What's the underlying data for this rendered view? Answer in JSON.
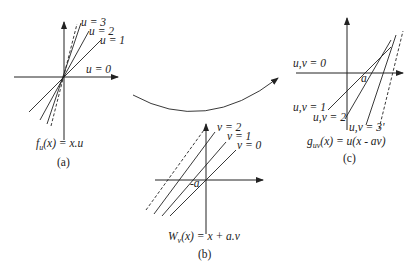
{
  "figure": {
    "panel_a": {
      "caption": "(a)",
      "formula": "fᵤ(x) = x.u",
      "formula_main": "f",
      "formula_sub": "u",
      "formula_rest": "(x) = x.u",
      "line_labels": [
        "u = 3",
        "u = 2",
        "u = 1",
        "u = 0"
      ]
    },
    "panel_b": {
      "caption": "(b)",
      "formula_main": "W",
      "formula_sub": "v",
      "formula_rest": "(x) = x + a.v",
      "line_labels": [
        "v = 2",
        "v = 1",
        "v = 0"
      ],
      "offset_label": "-a"
    },
    "panel_c": {
      "caption": "(c)",
      "formula_main": "g",
      "formula_sub": "uv",
      "formula_rest": "(x) = u(x - av)",
      "line_labels": [
        "u,v = 0",
        "u,v = 1",
        "u,v = 2",
        "u,v = 3'"
      ],
      "offset_label": "a"
    },
    "colors": {
      "ink": "#222222",
      "background": "#ffffff"
    }
  }
}
